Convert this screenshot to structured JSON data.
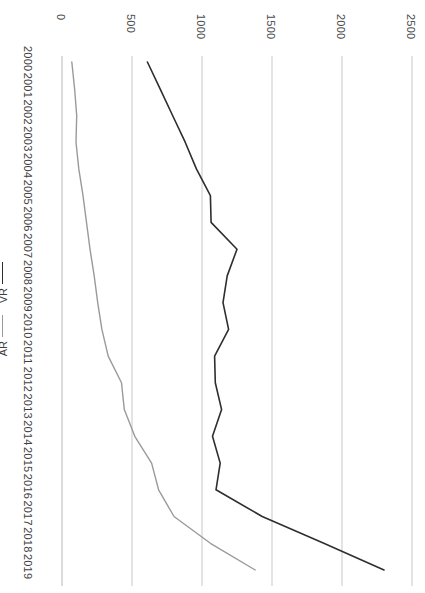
{
  "chart_data": {
    "type": "line",
    "title": "",
    "subtitle": "",
    "orientation": "rotated-90",
    "xlabel": "",
    "ylabel": "",
    "categories": [
      "2000",
      "2001",
      "2002",
      "2003",
      "2004",
      "2005",
      "2006",
      "2007",
      "2008",
      "2009",
      "2010",
      "2011",
      "2012",
      "2013",
      "2014",
      "2015",
      "2016",
      "2017",
      "2018",
      "2019"
    ],
    "value_ticks": [
      "0",
      "500",
      "1000",
      "1500",
      "2000",
      "2500"
    ],
    "value_tick_numbers": [
      0,
      500,
      1000,
      1500,
      2000,
      2500
    ],
    "vlim": [
      0,
      2600
    ],
    "grid": true,
    "legend_position": "left",
    "series": [
      {
        "name": "VR",
        "color": "#2e2e2e",
        "values": [
          610,
          700,
          790,
          880,
          960,
          1060,
          1065,
          1250,
          1180,
          1150,
          1190,
          1090,
          1095,
          1140,
          1075,
          1130,
          1100,
          1430,
          1870,
          2300
        ]
      },
      {
        "name": "AR",
        "color": "#9a9a9a",
        "values": [
          70,
          90,
          105,
          100,
          120,
          150,
          175,
          200,
          230,
          255,
          285,
          330,
          425,
          445,
          520,
          640,
          690,
          800,
          1060,
          1380
        ]
      }
    ]
  },
  "legend": {
    "items": [
      {
        "label": "VR",
        "color": "#2e2e2e"
      },
      {
        "label": "AR",
        "color": "#9a9a9a"
      }
    ]
  },
  "axis": {
    "value_axis_labels": [
      "0",
      "500",
      "1000",
      "1500",
      "2000",
      "2500"
    ],
    "category_axis_labels": [
      "2000",
      "2001",
      "2002",
      "2003",
      "2004",
      "2005",
      "2006",
      "2007",
      "2008",
      "2009",
      "2010",
      "2011",
      "2012",
      "2013",
      "2014",
      "2015",
      "2016",
      "2017",
      "2018",
      "2019"
    ]
  },
  "colors": {
    "grid": "#c9c9c9",
    "axis": "#b6b6b6",
    "background": "#ffffff",
    "text": "#3f3f3f"
  }
}
